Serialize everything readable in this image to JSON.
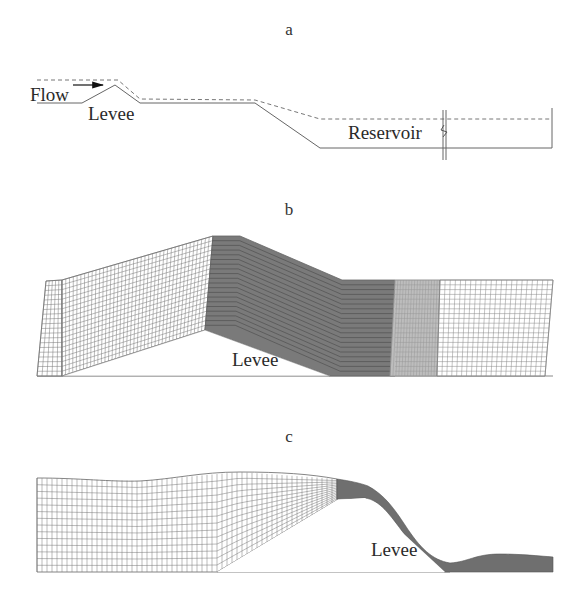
{
  "figure": {
    "panels": [
      {
        "id": "a",
        "label": "a",
        "description": "Schematic profile of flow over a levee into a reservoir",
        "annotations": {
          "flow": "Flow",
          "levee": "Levee",
          "reservoir": "Reservoir"
        }
      },
      {
        "id": "b",
        "label": "b",
        "description": "Initial computational mesh over levee",
        "annotations": {
          "levee": "Levee"
        }
      },
      {
        "id": "c",
        "label": "c",
        "description": "Deformed computational mesh showing free-surface flow over levee",
        "annotations": {
          "levee": "Levee"
        }
      }
    ],
    "colors": {
      "line": "#555555",
      "mesh_line": "#666666",
      "dense_mesh_fill": "#7a7a7a",
      "medium_mesh_fill": "#b5b5b5",
      "background": "#ffffff"
    }
  }
}
